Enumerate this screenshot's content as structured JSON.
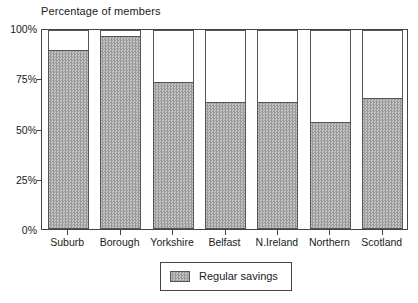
{
  "chart_data": {
    "type": "bar",
    "title": "Percentage of members",
    "xlabel": "",
    "ylabel": "",
    "ylim": [
      0,
      100
    ],
    "yticks": [
      0,
      25,
      50,
      75,
      100
    ],
    "ytick_labels": [
      "0%",
      "25%",
      "50%",
      "75%",
      "100%"
    ],
    "grid": false,
    "legend_position": "bottom-center",
    "categories": [
      "Suburb",
      "Borough",
      "Yorkshire",
      "Belfast",
      "N.Ireland",
      "Northern",
      "Scotland"
    ],
    "series": [
      {
        "name": "Regular savings",
        "values": [
          89,
          96,
          73,
          63,
          63,
          53,
          65
        ]
      }
    ]
  },
  "legend": {
    "entries": [
      {
        "label": "Regular savings",
        "swatch": "hatched-grey"
      }
    ]
  }
}
